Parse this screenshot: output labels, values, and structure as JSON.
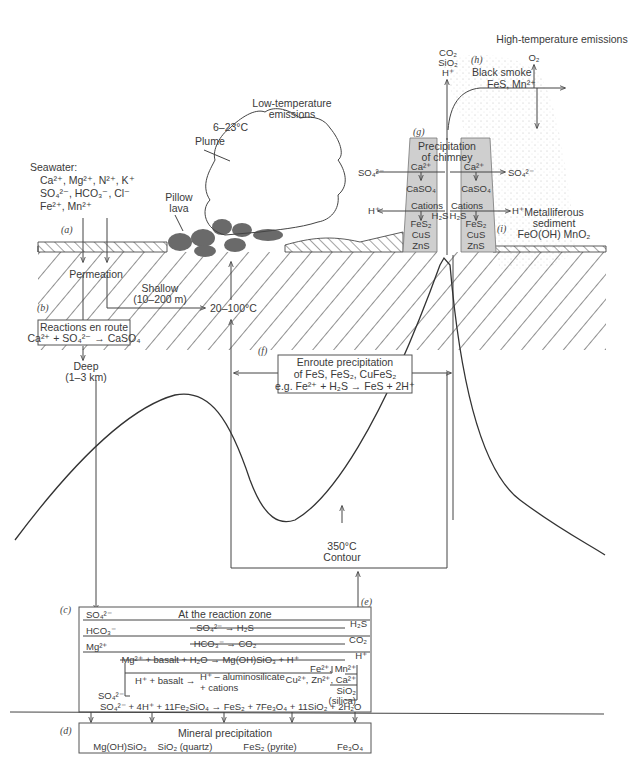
{
  "labels": {
    "a": "(a)",
    "b": "(b)",
    "c": "(c)",
    "d": "(d)",
    "e": "(e)",
    "f": "(f)",
    "g": "(g)",
    "h": "(h)",
    "i": "(i)"
  },
  "seawater": {
    "heading": "Seawater:",
    "line1": "Ca²⁺, Mg²⁺, N²⁺, K⁺",
    "line2": "SO₄²⁻, HCO₃⁻, Cl⁻",
    "line3": "Fe²⁺, Mn²⁺"
  },
  "low_temp": {
    "title1": "Low-temperature",
    "title2": "emissions",
    "temp": "6–23°C",
    "plume": "Plume"
  },
  "pillow_lava": {
    "line1": "Pillow",
    "line2": "lava"
  },
  "permeation": "Permeation",
  "shallow": {
    "line1": "Shallow",
    "line2": "(10–200 m)"
  },
  "temp_range": "20–100°C",
  "reactions_en_route": {
    "title": "Reactions en route",
    "equation": "Ca²⁺ + SO₄²⁻ → CaSO₄"
  },
  "deep": {
    "line1": "Deep",
    "line2": "(1–3 km)"
  },
  "enroute_precip": {
    "line1": "Enroute precipitation",
    "line2": "of FeS, FeS₂, CuFeS₂",
    "line3": "e.g. Fe²⁺ + H₂S → FeS + 2H⁺"
  },
  "contour": {
    "line1": "350°C",
    "line2": "Contour"
  },
  "high_temp": {
    "title": "High-temperature emissions",
    "outputs": [
      "CO₂",
      "SiO₂",
      "H⁺"
    ],
    "black_smoke": "Black smoke",
    "black_smoke_species": "FeS, Mn²⁺",
    "o2": "O₂"
  },
  "chimney": {
    "title1": "Precipitation",
    "title2": "of chimney",
    "ca_left": "Ca²⁺",
    "ca_right": "Ca²⁺",
    "so4_left": "SO₄²⁻",
    "so4_right": "SO₄²⁻",
    "caso4_left": "CaSO₄",
    "caso4_right": "CaSO₄",
    "h_left": "H⁺",
    "h_right": "H⁺",
    "cations_left": "Cations",
    "cations_right": "Cations",
    "h2s_left": "H₂S",
    "h2s_right": "H₂S",
    "minerals_left": [
      "FeS₂",
      "CuS",
      "ZnS"
    ],
    "minerals_right": [
      "FeS₂",
      "CuS",
      "ZnS"
    ]
  },
  "metalliferous": {
    "line1": "Metalliferous",
    "line2": "sediment",
    "line3": "FeO(OH) MnO₂"
  },
  "reaction_zone": {
    "title": "At the reaction zone",
    "rows": [
      {
        "input": "SO₄²⁻",
        "reaction": "SO₄²⁻ → H₂S",
        "output": "H₂S"
      },
      {
        "input": "HCO₃⁻",
        "reaction": "HCO₃⁻ → CO₂",
        "output": "CO₂"
      },
      {
        "input": "Mg²⁺",
        "reaction": "Mg²⁺ + basalt + H₂O → Mg(OH)SiO₃ + H⁺",
        "output": "H⁺"
      }
    ],
    "basalt_reaction": "H⁺ + basalt →",
    "basalt_products1": "H⁺ – aluminosilicate",
    "basalt_products2": "+ cations",
    "cations_out1": "Fe²⁺, Mn²⁺",
    "cations_out2": "Cu²⁺, Zn²⁺, Ca²⁺",
    "silica_out1": "SiO₂",
    "silica_out2": "(silica)",
    "so4_label": "SO₄²⁻",
    "final_equation": "SO₄²⁻ + 4H⁺ + 11Fe₂SiO₄ → FeS₂ + 7Fe₃O₄ + 11SiO₂ + 2H₂O"
  },
  "mineral_precip": {
    "title": "Mineral precipitation",
    "items": [
      "Mg(OH)SiO₃",
      "SiO₂ (quartz)",
      "FeS₂ (pyrite)",
      "Fe₃O₄"
    ]
  }
}
